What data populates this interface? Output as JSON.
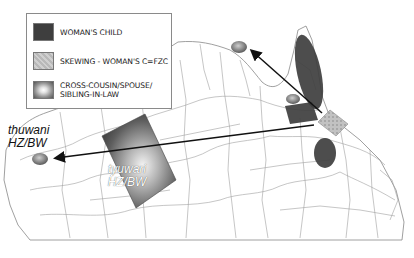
{
  "legend": {
    "items": [
      {
        "swatch": "dark-fill",
        "label": "WOMAN'S CHILD"
      },
      {
        "swatch": "light-stipple",
        "label": "SKEWING - WOMAN'S C=FZC"
      },
      {
        "swatch": "radial-gradient",
        "label_line1": "CROSS-COUSIN/SPOUSE/",
        "label_line2": "SIBLING-IN-LAW"
      }
    ]
  },
  "labels": {
    "thuwani": {
      "line1": "thuwani",
      "line2": "HZ/BW"
    },
    "tyuwari": {
      "line1": "tyuwari",
      "line2": "HZ/BW"
    }
  },
  "colors": {
    "dark_region": "#3e3e3e",
    "light_region": "#bdbdbd",
    "boundary": "#9a9a9a",
    "arrow": "#111111"
  }
}
